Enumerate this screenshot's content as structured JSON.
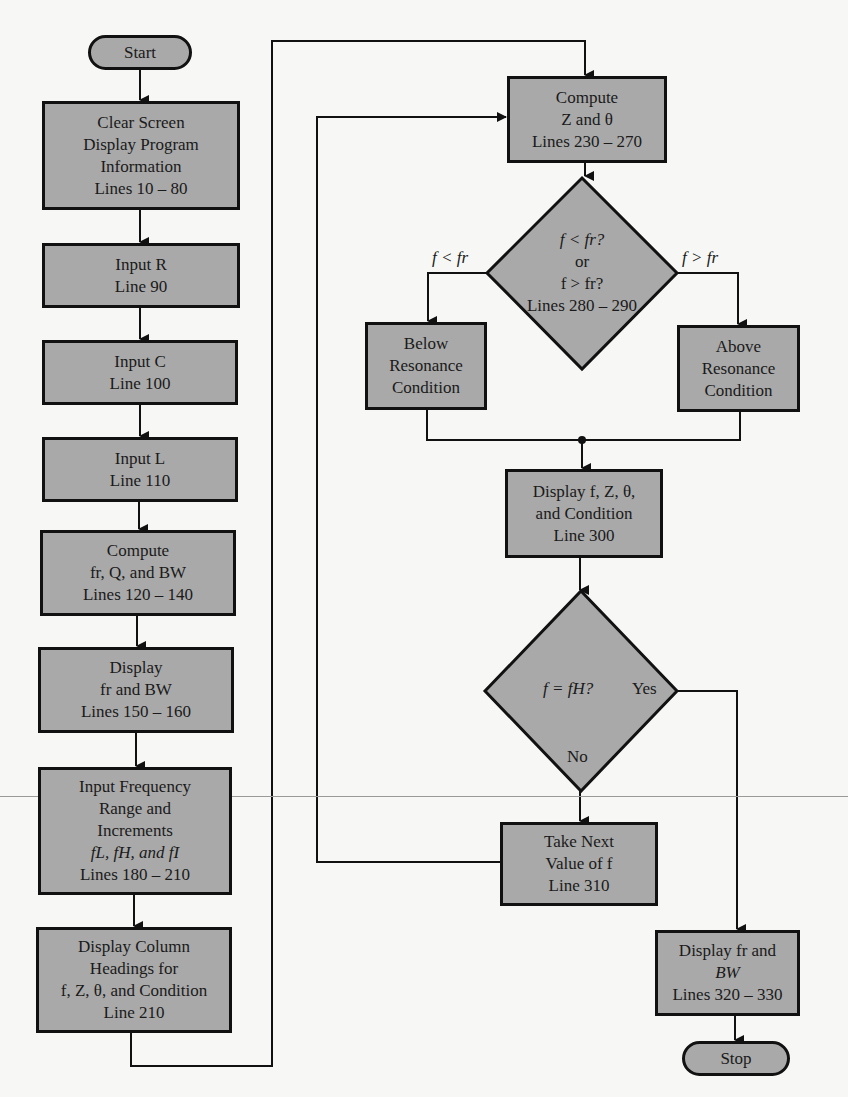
{
  "colors": {
    "box_fill": "#a9a9a9",
    "stroke": "#111111",
    "background": "#f7f7f5"
  },
  "left_column": {
    "start": "Start",
    "clear_screen": [
      "Clear Screen",
      "Display Program",
      "Information",
      "Lines 10 – 80"
    ],
    "input_r": [
      "Input R",
      "Line 90"
    ],
    "input_c": [
      "Input C",
      "Line 100"
    ],
    "input_l": [
      "Input L",
      "Line 110"
    ],
    "compute_fr": [
      "Compute",
      "fr, Q, and BW",
      "Lines 120 – 140"
    ],
    "display_fr": [
      "Display",
      "fr and BW",
      "Lines 150 – 160"
    ],
    "input_freq": [
      "Input Frequency",
      "Range and",
      "Increments",
      "fL, fH, and fI",
      "Lines 180 – 210"
    ],
    "display_headings": [
      "Display Column",
      "Headings for",
      "f, Z, θ, and Condition",
      "Line 210"
    ]
  },
  "right_column": {
    "compute_z": [
      "Compute",
      "Z and θ",
      "Lines 230 – 270"
    ],
    "decision_resonance": [
      "f < fr?",
      "or",
      "f > fr?",
      "Lines 280 – 290"
    ],
    "branch_below_label": "f < fr",
    "branch_above_label": "f > fr",
    "below_box": [
      "Below",
      "Resonance",
      "Condition"
    ],
    "above_box": [
      "Above",
      "Resonance",
      "Condition"
    ],
    "display_fz": [
      "Display f, Z, θ,",
      "and Condition",
      "Line 300"
    ],
    "decision_end": "f = fH?",
    "yes_label": "Yes",
    "no_label": "No",
    "take_next": [
      "Take Next",
      "Value of f",
      "Line 310"
    ],
    "display_final": [
      "Display fr and",
      "BW",
      "Lines 320 – 330"
    ],
    "stop": "Stop"
  }
}
